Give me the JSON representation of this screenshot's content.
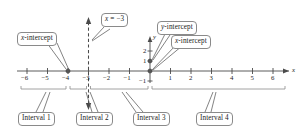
{
  "figure": {
    "kind": "number-line-sign-chart",
    "axis_label_x": "x",
    "axis_label_y": "y"
  },
  "axes": {
    "x_ticks": [
      "−6",
      "−5",
      "−4",
      "−3",
      "−2",
      "−1",
      "1",
      "2",
      "3",
      "4",
      "5",
      "6"
    ],
    "x_tick_values": [
      -6,
      -5,
      -4,
      -3,
      -2,
      -1,
      1,
      2,
      3,
      4,
      5,
      6
    ],
    "x_min": -6.6,
    "x_max": 6.6,
    "y_ticks": [
      "2",
      "1",
      "−1"
    ],
    "y_tick_values": [
      2,
      1,
      -1
    ],
    "origin_label": ""
  },
  "callouts": [
    {
      "id": "x-intercept-left",
      "label": "x-intercept",
      "italic_prefix": "x"
    },
    {
      "id": "vertical-asymptote",
      "label": "x = −3",
      "italic_prefix": "x"
    },
    {
      "id": "y-intercept",
      "label": "y-intercept",
      "italic_prefix": "y"
    },
    {
      "id": "x-intercept-right",
      "label": "x-intercept",
      "italic_prefix": "x"
    }
  ],
  "intervals": [
    {
      "label": "Interval 1",
      "from": -6.3,
      "to": -4.0
    },
    {
      "label": "Interval 2",
      "from": -4.0,
      "to": -3.0
    },
    {
      "label": "Interval 3",
      "from": -3.0,
      "to": 0.0
    },
    {
      "label": "Interval 4",
      "from": 0.0,
      "to": 6.3
    }
  ],
  "points": [
    {
      "name": "x-intercept at -4",
      "x": -4,
      "y": 0,
      "filled": true
    },
    {
      "name": "x-intercept at 0",
      "x": 0,
      "y": 0,
      "filled": true
    },
    {
      "name": "y-intercept",
      "x": 0,
      "y": 1,
      "filled": true
    }
  ],
  "dashed_line": {
    "name": "x = -3",
    "x": -3,
    "double_arrow": true
  },
  "colors": {
    "line": "#4a4a4a",
    "callout_border": "#8a8a8a",
    "text": "#1a1a1a",
    "background": "#ffffff"
  }
}
